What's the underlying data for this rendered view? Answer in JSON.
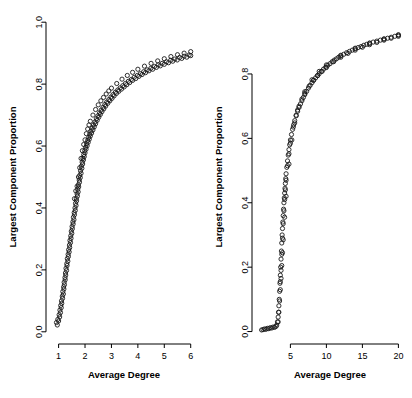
{
  "figure": {
    "background": "#ffffff",
    "point_color": "#1a1a1a",
    "axis_color": "#000000"
  },
  "chart_data": [
    {
      "type": "scatter",
      "panel": "left",
      "title": "",
      "xlabel": "Average Degree",
      "ylabel": "Largest Component Proportion",
      "xlim": [
        0.75,
        6.2
      ],
      "ylim": [
        -0.02,
        1.02
      ],
      "xticks": [
        1,
        2,
        3,
        4,
        5,
        6
      ],
      "xticklabels": [
        "1",
        "2",
        "3",
        "4",
        "5",
        "6"
      ],
      "yticks": [
        0.0,
        0.2,
        0.4,
        0.6,
        0.8,
        1.0
      ],
      "yticklabels": [
        "0.0",
        "0.2",
        "0.4",
        "0.6",
        "0.8",
        "1.0"
      ],
      "grid": false,
      "legend": null,
      "marker": "open-circle",
      "points": [
        [
          0.92,
          0.03
        ],
        [
          0.95,
          0.022
        ],
        [
          0.97,
          0.04
        ],
        [
          1.0,
          0.035
        ],
        [
          1.02,
          0.055
        ],
        [
          1.04,
          0.048
        ],
        [
          1.05,
          0.07
        ],
        [
          1.07,
          0.062
        ],
        [
          1.08,
          0.085
        ],
        [
          1.1,
          0.078
        ],
        [
          1.11,
          0.1
        ],
        [
          1.12,
          0.092
        ],
        [
          1.14,
          0.115
        ],
        [
          1.15,
          0.108
        ],
        [
          1.16,
          0.13
        ],
        [
          1.18,
          0.122
        ],
        [
          1.19,
          0.145
        ],
        [
          1.2,
          0.138
        ],
        [
          1.21,
          0.16
        ],
        [
          1.22,
          0.152
        ],
        [
          1.24,
          0.175
        ],
        [
          1.25,
          0.168
        ],
        [
          1.26,
          0.19
        ],
        [
          1.27,
          0.183
        ],
        [
          1.28,
          0.205
        ],
        [
          1.3,
          0.198
        ],
        [
          1.31,
          0.22
        ],
        [
          1.32,
          0.214
        ],
        [
          1.33,
          0.236
        ],
        [
          1.35,
          0.228
        ],
        [
          1.36,
          0.25
        ],
        [
          1.37,
          0.243
        ],
        [
          1.38,
          0.265
        ],
        [
          1.4,
          0.258
        ],
        [
          1.41,
          0.28
        ],
        [
          1.42,
          0.272
        ],
        [
          1.43,
          0.295
        ],
        [
          1.45,
          0.288
        ],
        [
          1.46,
          0.31
        ],
        [
          1.47,
          0.302
        ],
        [
          1.48,
          0.325
        ],
        [
          1.5,
          0.318
        ],
        [
          1.51,
          0.34
        ],
        [
          1.52,
          0.333
        ],
        [
          1.54,
          0.355
        ],
        [
          1.55,
          0.348
        ],
        [
          1.56,
          0.37
        ],
        [
          1.58,
          0.362
        ],
        [
          1.59,
          0.385
        ],
        [
          1.6,
          0.378
        ],
        [
          1.62,
          0.4
        ],
        [
          1.63,
          0.392
        ],
        [
          1.64,
          0.415
        ],
        [
          1.66,
          0.408
        ],
        [
          1.67,
          0.43
        ],
        [
          1.68,
          0.423
        ],
        [
          1.7,
          0.445
        ],
        [
          1.71,
          0.438
        ],
        [
          1.72,
          0.46
        ],
        [
          1.74,
          0.452
        ],
        [
          1.75,
          0.475
        ],
        [
          1.76,
          0.468
        ],
        [
          1.78,
          0.49
        ],
        [
          1.79,
          0.483
        ],
        [
          1.8,
          0.505
        ],
        [
          1.82,
          0.498
        ],
        [
          1.83,
          0.52
        ],
        [
          1.85,
          0.512
        ],
        [
          1.86,
          0.535
        ],
        [
          1.88,
          0.528
        ],
        [
          1.89,
          0.548
        ],
        [
          1.91,
          0.542
        ],
        [
          1.92,
          0.56
        ],
        [
          1.94,
          0.555
        ],
        [
          1.95,
          0.572
        ],
        [
          1.97,
          0.566
        ],
        [
          1.99,
          0.585
        ],
        [
          2.0,
          0.578
        ],
        [
          2.02,
          0.596
        ],
        [
          2.04,
          0.59
        ],
        [
          2.06,
          0.607
        ],
        [
          2.08,
          0.601
        ],
        [
          2.1,
          0.618
        ],
        [
          2.12,
          0.612
        ],
        [
          2.14,
          0.628
        ],
        [
          2.16,
          0.622
        ],
        [
          2.18,
          0.638
        ],
        [
          2.2,
          0.632
        ],
        [
          2.22,
          0.648
        ],
        [
          2.25,
          0.642
        ],
        [
          2.27,
          0.658
        ],
        [
          2.3,
          0.652
        ],
        [
          2.32,
          0.668
        ],
        [
          2.35,
          0.662
        ],
        [
          2.38,
          0.678
        ],
        [
          2.4,
          0.672
        ],
        [
          2.43,
          0.688
        ],
        [
          2.46,
          0.683
        ],
        [
          2.49,
          0.698
        ],
        [
          2.52,
          0.693
        ],
        [
          2.55,
          0.707
        ],
        [
          2.58,
          0.702
        ],
        [
          2.61,
          0.716
        ],
        [
          2.64,
          0.711
        ],
        [
          2.68,
          0.725
        ],
        [
          2.71,
          0.72
        ],
        [
          2.75,
          0.734
        ],
        [
          2.78,
          0.729
        ],
        [
          2.82,
          0.742
        ],
        [
          2.86,
          0.738
        ],
        [
          2.9,
          0.75
        ],
        [
          2.94,
          0.746
        ],
        [
          2.98,
          0.758
        ],
        [
          3.02,
          0.754
        ],
        [
          3.06,
          0.766
        ],
        [
          3.1,
          0.762
        ],
        [
          3.15,
          0.774
        ],
        [
          3.19,
          0.77
        ],
        [
          3.24,
          0.781
        ],
        [
          3.28,
          0.777
        ],
        [
          3.33,
          0.788
        ],
        [
          3.38,
          0.784
        ],
        [
          3.43,
          0.795
        ],
        [
          3.48,
          0.791
        ],
        [
          3.53,
          0.802
        ],
        [
          3.58,
          0.798
        ],
        [
          3.64,
          0.809
        ],
        [
          3.69,
          0.805
        ],
        [
          3.75,
          0.815
        ],
        [
          3.8,
          0.812
        ],
        [
          3.86,
          0.822
        ],
        [
          3.92,
          0.818
        ],
        [
          3.98,
          0.828
        ],
        [
          4.04,
          0.825
        ],
        [
          4.1,
          0.834
        ],
        [
          4.16,
          0.831
        ],
        [
          4.22,
          0.84
        ],
        [
          4.29,
          0.837
        ],
        [
          4.35,
          0.846
        ],
        [
          4.42,
          0.843
        ],
        [
          4.49,
          0.851
        ],
        [
          4.56,
          0.848
        ],
        [
          4.63,
          0.857
        ],
        [
          4.7,
          0.854
        ],
        [
          4.77,
          0.862
        ],
        [
          4.85,
          0.859
        ],
        [
          4.92,
          0.867
        ],
        [
          5.0,
          0.864
        ],
        [
          5.08,
          0.872
        ],
        [
          5.16,
          0.869
        ],
        [
          5.24,
          0.877
        ],
        [
          5.32,
          0.874
        ],
        [
          5.4,
          0.881
        ],
        [
          5.49,
          0.878
        ],
        [
          5.58,
          0.886
        ],
        [
          5.66,
          0.883
        ],
        [
          5.75,
          0.89
        ],
        [
          5.85,
          0.887
        ],
        [
          5.94,
          0.894
        ],
        [
          6.0,
          0.892
        ],
        [
          1.6,
          0.43
        ],
        [
          1.65,
          0.455
        ],
        [
          1.7,
          0.47
        ],
        [
          1.75,
          0.5
        ],
        [
          1.8,
          0.53
        ],
        [
          1.85,
          0.56
        ],
        [
          1.9,
          0.585
        ],
        [
          1.95,
          0.605
        ],
        [
          2.0,
          0.62
        ],
        [
          2.05,
          0.64
        ],
        [
          2.1,
          0.655
        ],
        [
          2.15,
          0.668
        ],
        [
          2.2,
          0.68
        ],
        [
          2.3,
          0.7
        ],
        [
          2.4,
          0.718
        ],
        [
          2.5,
          0.733
        ],
        [
          2.6,
          0.746
        ],
        [
          2.7,
          0.757
        ],
        [
          2.8,
          0.768
        ],
        [
          2.9,
          0.778
        ],
        [
          3.0,
          0.787
        ],
        [
          3.2,
          0.802
        ],
        [
          3.4,
          0.816
        ],
        [
          3.6,
          0.828
        ],
        [
          3.8,
          0.838
        ],
        [
          4.0,
          0.848
        ],
        [
          4.25,
          0.858
        ],
        [
          4.5,
          0.867
        ],
        [
          4.75,
          0.875
        ],
        [
          5.0,
          0.882
        ],
        [
          5.25,
          0.889
        ],
        [
          5.5,
          0.895
        ],
        [
          5.75,
          0.9
        ],
        [
          6.0,
          0.905
        ]
      ]
    },
    {
      "type": "scatter",
      "panel": "right",
      "title": "",
      "xlabel": "Average Degree",
      "ylabel": "Largest Component Proportion",
      "xlim": [
        0.5,
        20.5
      ],
      "ylim": [
        -0.02,
        0.98
      ],
      "xticks": [
        5,
        10,
        15,
        20
      ],
      "xticklabels": [
        "5",
        "10",
        "15",
        "20"
      ],
      "yticks": [
        0.0,
        0.2,
        0.4,
        0.6,
        0.8
      ],
      "yticklabels": [
        "0.0",
        "0.2",
        "0.4",
        "0.6",
        "0.8"
      ],
      "grid": false,
      "legend": null,
      "marker": "open-circle",
      "points": [
        [
          1.0,
          0.005
        ],
        [
          1.2,
          0.006
        ],
        [
          1.4,
          0.008
        ],
        [
          1.6,
          0.007
        ],
        [
          1.8,
          0.01
        ],
        [
          2.0,
          0.009
        ],
        [
          2.2,
          0.012
        ],
        [
          2.4,
          0.011
        ],
        [
          2.6,
          0.014
        ],
        [
          2.8,
          0.013
        ],
        [
          3.0,
          0.016
        ],
        [
          3.1,
          0.02
        ],
        [
          3.2,
          0.03
        ],
        [
          3.3,
          0.045
        ],
        [
          3.35,
          0.06
        ],
        [
          3.4,
          0.08
        ],
        [
          3.45,
          0.1
        ],
        [
          3.5,
          0.125
        ],
        [
          3.55,
          0.15
        ],
        [
          3.6,
          0.175
        ],
        [
          3.65,
          0.2
        ],
        [
          3.7,
          0.225
        ],
        [
          3.75,
          0.25
        ],
        [
          3.8,
          0.275
        ],
        [
          3.85,
          0.3
        ],
        [
          3.9,
          0.32
        ],
        [
          3.95,
          0.34
        ],
        [
          4.0,
          0.36
        ],
        [
          4.05,
          0.38
        ],
        [
          4.1,
          0.4
        ],
        [
          4.15,
          0.415
        ],
        [
          4.2,
          0.43
        ],
        [
          4.25,
          0.445
        ],
        [
          4.3,
          0.46
        ],
        [
          4.35,
          0.475
        ],
        [
          4.4,
          0.49
        ],
        [
          4.5,
          0.51
        ],
        [
          4.6,
          0.53
        ],
        [
          4.7,
          0.548
        ],
        [
          4.8,
          0.565
        ],
        [
          4.9,
          0.58
        ],
        [
          5.0,
          0.595
        ],
        [
          5.15,
          0.612
        ],
        [
          5.3,
          0.628
        ],
        [
          5.45,
          0.642
        ],
        [
          5.6,
          0.655
        ],
        [
          5.8,
          0.67
        ],
        [
          6.0,
          0.684
        ],
        [
          6.2,
          0.696
        ],
        [
          6.4,
          0.707
        ],
        [
          6.6,
          0.717
        ],
        [
          6.8,
          0.727
        ],
        [
          7.0,
          0.736
        ],
        [
          7.25,
          0.746
        ],
        [
          7.5,
          0.756
        ],
        [
          7.75,
          0.765
        ],
        [
          8.0,
          0.773
        ],
        [
          8.25,
          0.781
        ],
        [
          8.5,
          0.788
        ],
        [
          8.75,
          0.795
        ],
        [
          9.0,
          0.801
        ],
        [
          9.3,
          0.808
        ],
        [
          9.6,
          0.815
        ],
        [
          9.9,
          0.821
        ],
        [
          10.2,
          0.827
        ],
        [
          10.5,
          0.832
        ],
        [
          10.8,
          0.838
        ],
        [
          11.1,
          0.843
        ],
        [
          11.4,
          0.847
        ],
        [
          11.7,
          0.852
        ],
        [
          12.0,
          0.856
        ],
        [
          12.4,
          0.861
        ],
        [
          12.8,
          0.866
        ],
        [
          13.2,
          0.87
        ],
        [
          13.6,
          0.874
        ],
        [
          14.0,
          0.878
        ],
        [
          14.4,
          0.882
        ],
        [
          14.8,
          0.885
        ],
        [
          15.2,
          0.889
        ],
        [
          15.6,
          0.892
        ],
        [
          16.0,
          0.895
        ],
        [
          16.5,
          0.899
        ],
        [
          17.0,
          0.902
        ],
        [
          17.5,
          0.905
        ],
        [
          18.0,
          0.908
        ],
        [
          18.5,
          0.911
        ],
        [
          19.0,
          0.914
        ],
        [
          19.5,
          0.917
        ],
        [
          20.0,
          0.92
        ],
        [
          3.6,
          0.155
        ],
        [
          3.7,
          0.19
        ],
        [
          3.8,
          0.24
        ],
        [
          3.9,
          0.29
        ],
        [
          4.0,
          0.335
        ],
        [
          4.1,
          0.375
        ],
        [
          4.2,
          0.41
        ],
        [
          4.3,
          0.44
        ],
        [
          4.4,
          0.47
        ],
        [
          4.6,
          0.515
        ],
        [
          4.8,
          0.552
        ],
        [
          5.0,
          0.585
        ],
        [
          5.4,
          0.635
        ],
        [
          5.8,
          0.672
        ],
        [
          6.2,
          0.7
        ],
        [
          6.6,
          0.722
        ],
        [
          7.0,
          0.74
        ],
        [
          7.6,
          0.762
        ],
        [
          8.2,
          0.78
        ],
        [
          8.8,
          0.795
        ],
        [
          9.4,
          0.808
        ],
        [
          10.0,
          0.82
        ],
        [
          11.0,
          0.838
        ],
        [
          12.0,
          0.852
        ],
        [
          13.0,
          0.864
        ],
        [
          14.0,
          0.874
        ],
        [
          15.0,
          0.883
        ],
        [
          16.0,
          0.891
        ],
        [
          17.0,
          0.898
        ],
        [
          18.0,
          0.905
        ],
        [
          19.0,
          0.911
        ],
        [
          20.0,
          0.917
        ],
        [
          3.3,
          0.03
        ],
        [
          3.4,
          0.06
        ],
        [
          3.5,
          0.095
        ],
        [
          3.6,
          0.13
        ],
        [
          3.7,
          0.165
        ],
        [
          3.8,
          0.205
        ],
        [
          3.9,
          0.245
        ],
        [
          4.0,
          0.285
        ],
        [
          4.2,
          0.355
        ],
        [
          4.4,
          0.42
        ],
        [
          4.8,
          0.52
        ],
        [
          5.2,
          0.595
        ],
        [
          5.6,
          0.648
        ],
        [
          6.0,
          0.688
        ],
        [
          7.0,
          0.745
        ],
        [
          8.0,
          0.782
        ],
        [
          9.0,
          0.808
        ],
        [
          10.0,
          0.828
        ],
        [
          12.0,
          0.858
        ],
        [
          14.0,
          0.88
        ],
        [
          16.0,
          0.896
        ],
        [
          18.0,
          0.909
        ],
        [
          20.0,
          0.922
        ]
      ]
    }
  ]
}
